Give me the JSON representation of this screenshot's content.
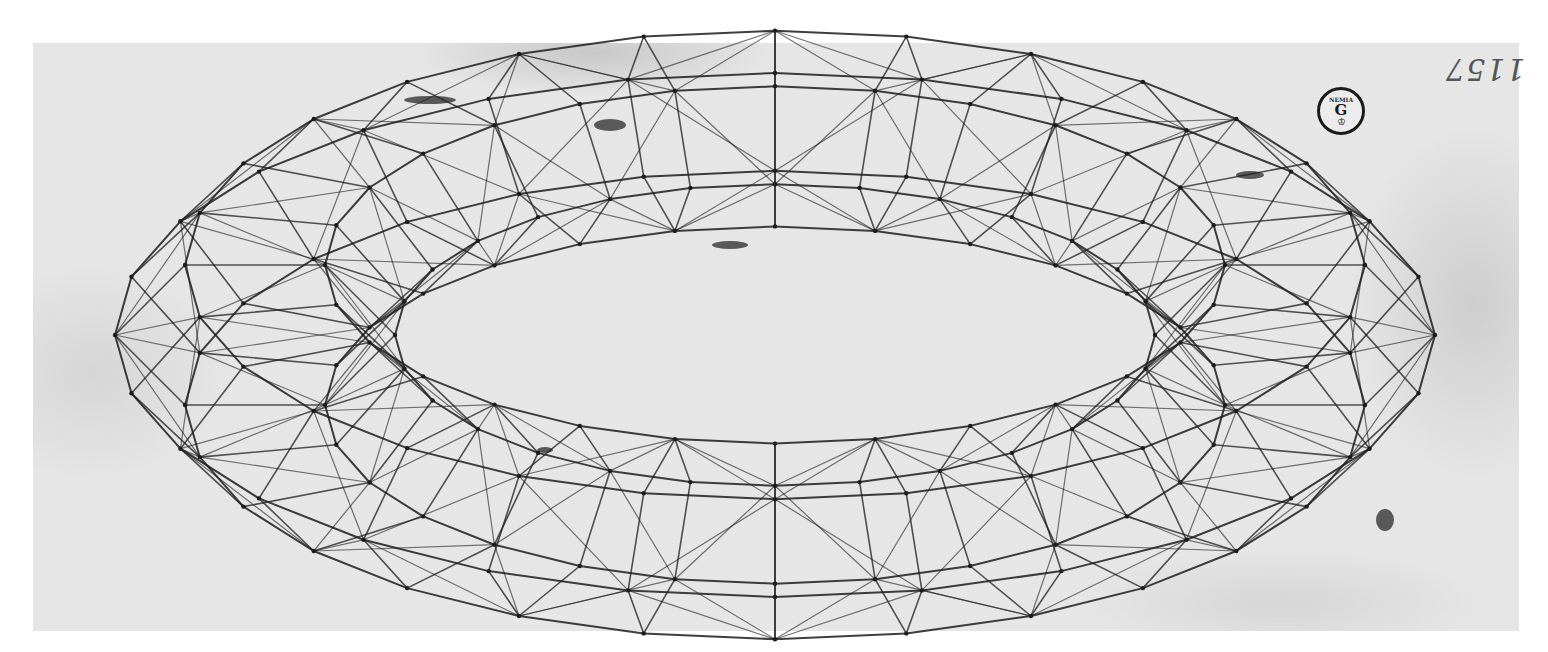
{
  "artwork": {
    "subject": "wireframe faceted torus (mazzocchio) perspective drawing",
    "medium": "ink on paper",
    "colors": {
      "ink": "#1c1c1c",
      "paper": "#e6e6e6",
      "background": "#ffffff"
    },
    "geometry": {
      "center_x": 775,
      "center_y": 335,
      "outer_rx": 660,
      "outer_ry": 262,
      "inner_rx": 380,
      "inner_ry": 95,
      "segments": 28,
      "tube_rings": 6
    }
  },
  "inscription": {
    "text": "1157",
    "orientation": "upside-down"
  },
  "stamp": {
    "arc_text": "NEMIA",
    "letter": "G",
    "crown": "♔"
  }
}
